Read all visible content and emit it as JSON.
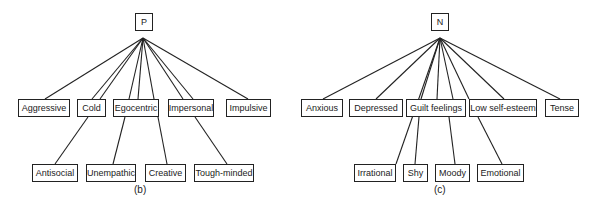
{
  "diagram_b": {
    "root": "P",
    "caption": "(b)",
    "top_row": [
      "Aggressive",
      "Cold",
      "Egocentric",
      "Impersonal",
      "Impulsive"
    ],
    "bottom_row": [
      "Antisocial",
      "Unempathic",
      "Creative",
      "Tough-minded"
    ]
  },
  "diagram_c": {
    "root": "N",
    "caption": "(c)",
    "top_row": [
      "Anxious",
      "Depressed",
      "Guilt feelings",
      "Low self-esteem",
      "Tense"
    ],
    "bottom_row": [
      "Irrational",
      "Shy",
      "Moody",
      "Emotional"
    ]
  }
}
